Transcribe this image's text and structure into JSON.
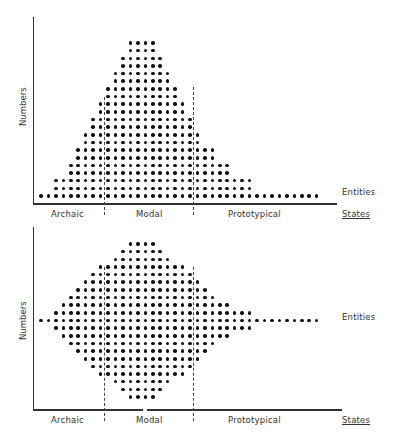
{
  "figure": {
    "top": {
      "y_label": "Numbers",
      "series_label": "Entities",
      "x_axis_title": "States",
      "categories": [
        "Archaic",
        "Modal",
        "Prototypical"
      ],
      "shape": "skewed pyramid"
    },
    "bottom": {
      "y_label": "Numbers",
      "series_label": "Entities",
      "x_axis_title": "States",
      "categories": [
        "Archaic",
        "Modal",
        "Prototypical"
      ],
      "shape": "diamond / spindle"
    }
  },
  "chart_data": [
    {
      "type": "scatter",
      "title": "",
      "xlabel": "States",
      "ylabel": "Numbers",
      "legend": [
        "Entities"
      ],
      "categories": [
        "Archaic",
        "Modal",
        "Prototypical"
      ],
      "grid": false,
      "column_count": 38,
      "rows_top_to_bottom": [
        [
          12,
          15
        ],
        [
          12,
          15
        ],
        [
          11,
          16
        ],
        [
          11,
          16
        ],
        [
          10,
          17
        ],
        [
          10,
          17
        ],
        [
          9,
          18
        ],
        [
          9,
          18
        ],
        [
          8,
          19
        ],
        [
          8,
          19
        ],
        [
          7,
          20
        ],
        [
          7,
          20
        ],
        [
          6,
          21
        ],
        [
          6,
          21
        ],
        [
          5,
          23
        ],
        [
          5,
          23
        ],
        [
          4,
          25
        ],
        [
          4,
          25
        ],
        [
          2,
          28
        ],
        [
          2,
          28
        ],
        [
          0,
          37
        ]
      ]
    },
    {
      "type": "scatter",
      "title": "",
      "xlabel": "States",
      "ylabel": "Numbers",
      "legend": [
        "Entities"
      ],
      "categories": [
        "Archaic",
        "Modal",
        "Prototypical"
      ],
      "grid": false,
      "column_count": 38,
      "rows_top_to_bottom": [
        [
          12,
          15
        ],
        [
          11,
          16
        ],
        [
          10,
          17
        ],
        [
          8,
          19
        ],
        [
          7,
          20
        ],
        [
          6,
          21
        ],
        [
          5,
          22
        ],
        [
          4,
          23
        ],
        [
          3,
          25
        ],
        [
          2,
          28
        ],
        [
          0,
          37
        ],
        [
          2,
          28
        ],
        [
          3,
          25
        ],
        [
          4,
          23
        ],
        [
          5,
          22
        ],
        [
          6,
          21
        ],
        [
          7,
          20
        ],
        [
          8,
          19
        ],
        [
          10,
          17
        ],
        [
          11,
          16
        ],
        [
          12,
          15
        ]
      ]
    }
  ]
}
